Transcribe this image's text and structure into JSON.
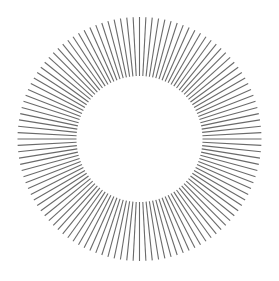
{
  "figure": {
    "type": "radial-line-burst",
    "width": 279,
    "height": 281,
    "background": "#ffffff",
    "center": {
      "x": 139.5,
      "y": 139
    },
    "inner_radius": 63,
    "outer_radius": 122,
    "line_count": 120,
    "line_color": "#6a6a6a",
    "line_width": 1.1
  }
}
